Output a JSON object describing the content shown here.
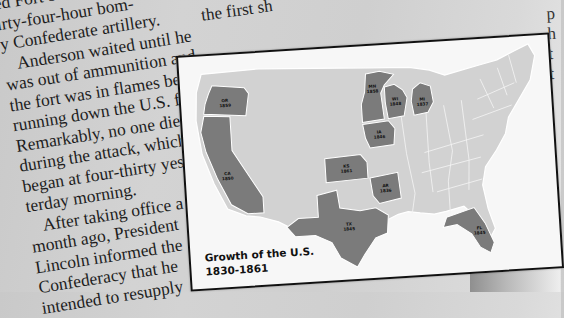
{
  "article": {
    "left_column_lines": [
      "ed Fort Sumter after a",
      "irty-four-hour bom-",
      "y Confederate artillery.",
      "Anderson waited until he",
      "was out of ammunition and",
      "the fort was in flames before",
      "running down the U.S. flag.",
      "Remarkably, no one died",
      "during the attack, which",
      "began at four-thirty yes-",
      "terday morning.",
      "After taking office a",
      "month ago, President",
      "Lincoln informed the",
      "Confederacy that he",
      "intended to resupply"
    ],
    "top_fragment": "the first sh",
    "right_fragment_lines": [
      "p",
      "h",
      "t",
      "t"
    ]
  },
  "map": {
    "title_line1": "Growth of the U.S.",
    "title_line2": "1830-1861",
    "colors": {
      "card_background": "#f7f7f7",
      "base_state_fill": "#d2d2d2",
      "highlight_state_fill": "#7b7b7b",
      "border": "#111111"
    },
    "highlighted_states": [
      {
        "abbr": "OR",
        "year": "1859"
      },
      {
        "abbr": "CA",
        "year": "1850"
      },
      {
        "abbr": "MN",
        "year": "1858"
      },
      {
        "abbr": "WI",
        "year": "1848"
      },
      {
        "abbr": "MI",
        "year": "1837"
      },
      {
        "abbr": "IA",
        "year": "1846"
      },
      {
        "abbr": "KS",
        "year": "1861"
      },
      {
        "abbr": "AR",
        "year": "1836"
      },
      {
        "abbr": "TX",
        "year": "1845"
      },
      {
        "abbr": "FL",
        "year": "1845"
      }
    ]
  }
}
